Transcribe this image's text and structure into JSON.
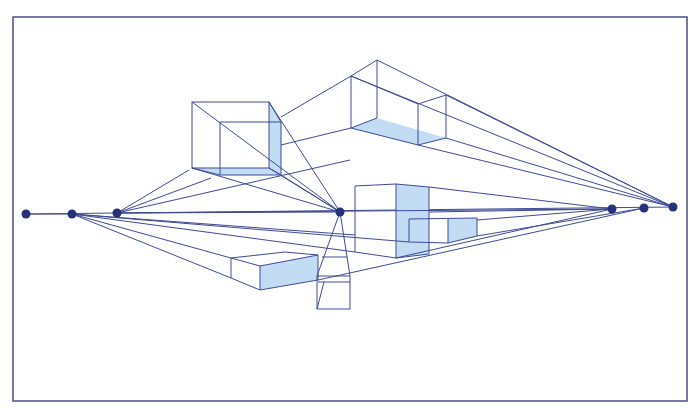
{
  "diagram": {
    "type": "perspective-drawing",
    "colors": {
      "line": "#3e4a96",
      "frame": "#4a4e8a",
      "shade": "#c2dcf3",
      "point": "#27317a",
      "background": "#ffffff"
    },
    "frame": {
      "x": 13,
      "y": 17,
      "width": 674,
      "height": 384
    },
    "horizon_y": 212,
    "vanishing_points": [
      {
        "id": "vp-left-1",
        "x": 26,
        "y": 214
      },
      {
        "id": "vp-left-2",
        "x": 72,
        "y": 214
      },
      {
        "id": "vp-left-3",
        "x": 117,
        "y": 213
      },
      {
        "id": "vp-center",
        "x": 340,
        "y": 212
      },
      {
        "id": "vp-right-1",
        "x": 612,
        "y": 209
      },
      {
        "id": "vp-right-2",
        "x": 644,
        "y": 208
      },
      {
        "id": "vp-right-3",
        "x": 673,
        "y": 207
      }
    ],
    "objects": [
      "cube-upper-left",
      "long-box-top",
      "tall-box-center",
      "small-box-right",
      "flat-box-lower-left",
      "tapered-column-below-center"
    ]
  }
}
